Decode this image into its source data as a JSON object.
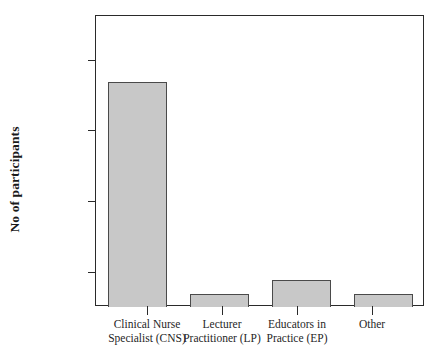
{
  "chart_data": {
    "type": "bar",
    "title": "",
    "subtitle": "",
    "xlabel": "",
    "ylabel": "No of participants",
    "categories": [
      "Clinical Nurse\nSpecialist (CNS)",
      "Lecturer\nPractitioner (LP)",
      "Educators in\nPractice (EP)",
      "Other"
    ],
    "values": [
      37,
      7,
      9,
      7
    ],
    "series": [
      {
        "name": "No of participants",
        "values": [
          37,
          7,
          9,
          7
        ]
      }
    ],
    "ytick_labels": [
      "40",
      "30",
      "20",
      "10"
    ],
    "ytick_values": [
      40,
      30,
      20,
      10
    ],
    "ylim": [
      5.2,
      46.3
    ],
    "xlim": [
      0,
      4
    ],
    "grid": false,
    "legend": false,
    "legend_position": "none",
    "bar_fill_color": "#c8c8c8",
    "bar_border_color": "#4a4a4a",
    "axis_color": "#2a2a2a",
    "background_color": "#ffffff",
    "annotations": []
  },
  "axes": {
    "y_title": "No of participants",
    "ticks_y": [
      {
        "label": "40",
        "value": 40
      },
      {
        "label": "30",
        "value": 30
      },
      {
        "label": "20",
        "value": 20
      },
      {
        "label": "10",
        "value": 10
      }
    ]
  },
  "bars": [
    {
      "label": "Clinical Nurse\nSpecialist (CNS)",
      "value": 37
    },
    {
      "label": "Lecturer\nPractitioner (LP)",
      "value": 7
    },
    {
      "label": "Educators in\nPractice (EP)",
      "value": 9
    },
    {
      "label": "Other",
      "value": 7
    }
  ]
}
